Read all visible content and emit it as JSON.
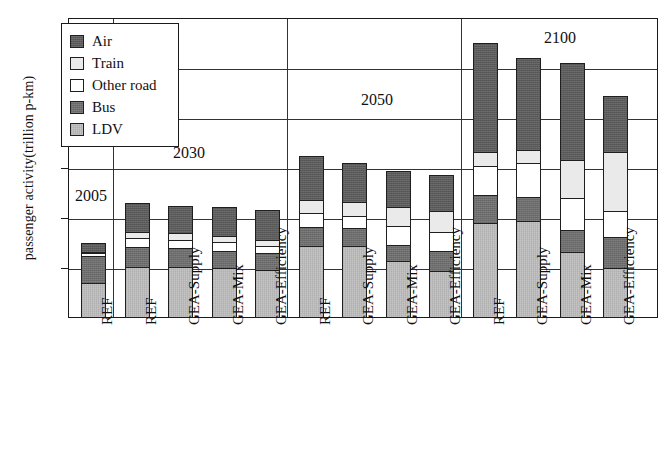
{
  "chart_data": {
    "type": "bar",
    "stacked": true,
    "title": "",
    "xlabel": "",
    "ylabel": "passenger activity(trillion p-km)",
    "ylim": [
      0,
      120
    ],
    "yticks": [
      0,
      20,
      40,
      60,
      80,
      100,
      120
    ],
    "grid": true,
    "legend_position": "top-left",
    "legend_entries": [
      "Air",
      "Train",
      "Other road",
      "Bus",
      "LDV"
    ],
    "series": [
      {
        "name": "LDV",
        "color": "#bdbdbd",
        "values": [
          14,
          20.5,
          20.5,
          20,
          19,
          29,
          29,
          22.5,
          27
        ]
      },
      {
        "name": "Bus",
        "color": "#6e6e6e",
        "values": [
          11.5,
          8.5,
          8,
          7,
          7.5,
          7.5,
          8,
          7,
          9
        ]
      },
      {
        "name": "Other road",
        "color": "#ffffff",
        "values": [
          1.5,
          4,
          4,
          4,
          3,
          6,
          6,
          7,
          7
        ]
      },
      {
        "name": "Train",
        "color": "#eaeaea",
        "values": [
          1,
          3,
          3,
          3,
          3,
          6,
          6,
          8,
          8
        ]
      },
      {
        "name": "Air",
        "color": "#5b5b5b",
        "values": [
          4,
          12,
          11.5,
          12,
          13,
          18.5,
          15,
          16.5,
          8.5
        ]
      }
    ],
    "groups": [
      {
        "year": "2005",
        "categories": [
          "REF"
        ]
      },
      {
        "year": "2030",
        "categories": [
          "REF",
          "GEA-Supply",
          "GEA-Mix",
          "GEA-Efficiency"
        ]
      },
      {
        "year": "2050",
        "categories": [
          "REF",
          "GEA-Supply",
          "GEA-Mix",
          "GEA-Efficiency"
        ]
      },
      {
        "year": "2100",
        "categories": [
          "REF",
          "GEA-Supply",
          "GEA-Mix",
          "GEA-Efficiency"
        ]
      }
    ],
    "bars": [
      {
        "group": "2005",
        "label": "REF",
        "total": 32,
        "ldv": 14,
        "bus": 11.5,
        "other_road": 1.5,
        "train": 1,
        "air": 4
      },
      {
        "group": "2030",
        "label": "REF",
        "total": 48,
        "ldv": 20.5,
        "bus": 8.5,
        "other_road": 4,
        "train": 3,
        "air": 12
      },
      {
        "group": "2030",
        "label": "GEA-Supply",
        "total": 47,
        "ldv": 20.5,
        "bus": 8,
        "other_road": 4,
        "train": 3,
        "air": 11.5
      },
      {
        "group": "2030",
        "label": "GEA-Mix",
        "total": 46.5,
        "ldv": 20,
        "bus": 7.5,
        "other_road": 4,
        "train": 3,
        "air": 12
      },
      {
        "group": "2030",
        "label": "GEA-Efficiency",
        "total": 45.5,
        "ldv": 19.5,
        "bus": 7,
        "other_road": 3.5,
        "train": 3,
        "air": 12.5
      },
      {
        "group": "2050",
        "label": "REF",
        "total": 67,
        "ldv": 29,
        "bus": 8,
        "other_road": 6,
        "train": 6,
        "air": 18
      },
      {
        "group": "2050",
        "label": "GEA-Supply",
        "total": 64,
        "ldv": 29,
        "bus": 7.5,
        "other_road": 5.5,
        "train": 6,
        "air": 16
      },
      {
        "group": "2050",
        "label": "GEA-Mix",
        "total": 61,
        "ldv": 23,
        "bus": 7,
        "other_road": 8,
        "train": 8,
        "air": 15
      },
      {
        "group": "2050",
        "label": "GEA-Efficiency",
        "total": 59.5,
        "ldv": 19,
        "bus": 8.5,
        "other_road": 8,
        "train": 9,
        "air": 15
      },
      {
        "group": "2100",
        "label": "REF",
        "total": 112,
        "ldv": 38,
        "bus": 12,
        "other_road": 12,
        "train": 6,
        "air": 44
      },
      {
        "group": "2100",
        "label": "GEA-Supply",
        "total": 106,
        "ldv": 39,
        "bus": 10,
        "other_road": 14,
        "train": 6,
        "air": 37
      },
      {
        "group": "2100",
        "label": "GEA-Mix",
        "total": 104,
        "ldv": 26.5,
        "bus": 9.5,
        "other_road": 13,
        "train": 16,
        "air": 39
      },
      {
        "group": "2100",
        "label": "GEA-Efficiency",
        "total": 91,
        "ldv": 20,
        "bus": 13,
        "other_road": 11,
        "train": 24,
        "air": 23
      }
    ]
  },
  "axis": {
    "y_title": "passenger activity(trillion p-km)",
    "y_labels": [
      "120",
      "100",
      "80",
      "60",
      "40",
      "20",
      "0"
    ]
  },
  "legend": {
    "items": [
      {
        "label": "Air",
        "swatch": "air"
      },
      {
        "label": "Train",
        "swatch": "train"
      },
      {
        "label": "Other road",
        "swatch": "other"
      },
      {
        "label": "Bus",
        "swatch": "bus"
      },
      {
        "label": "LDV",
        "swatch": "ldv"
      }
    ]
  },
  "era_labels": [
    {
      "text": "2005"
    },
    {
      "text": "2030"
    },
    {
      "text": "2050"
    },
    {
      "text": "2100"
    }
  ],
  "x_labels": [
    "REF",
    "REF",
    "GEA-Supply",
    "GEA-Mix",
    "GEA-Efficiency",
    "REF",
    "GEA-Supply",
    "GEA-Mix",
    "GEA-Efficiency",
    "REF",
    "GEA-Supply",
    "GEA-Mix",
    "GEA-Efficiency"
  ]
}
